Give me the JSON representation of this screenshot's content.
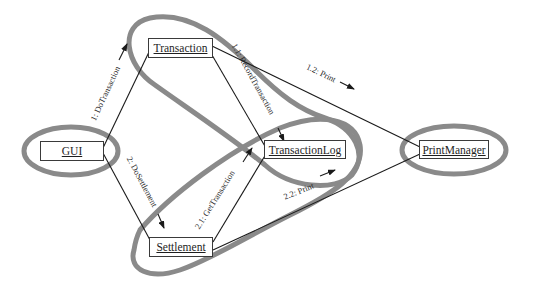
{
  "diagram": {
    "type": "UML collaboration diagram with clustered groupings",
    "objects": [
      {
        "id": "gui",
        "label": "GUI"
      },
      {
        "id": "transaction",
        "label": "Transaction"
      },
      {
        "id": "transactionlog",
        "label": "TransactionLog"
      },
      {
        "id": "settlement",
        "label": "Settlement"
      },
      {
        "id": "printmanager",
        "label": "PrintManager"
      }
    ],
    "messages": [
      {
        "id": "m1",
        "label": "1: DoTransaction",
        "from": "GUI",
        "to": "Transaction"
      },
      {
        "id": "m11",
        "label": "1.1: RecordTransaction",
        "from": "Transaction",
        "to": "TransactionLog"
      },
      {
        "id": "m12",
        "label": "1.2: Print",
        "from": "Transaction",
        "to": "PrintManager"
      },
      {
        "id": "m2",
        "label": "2: DoSettlement",
        "from": "GUI",
        "to": "Settlement"
      },
      {
        "id": "m21",
        "label": "2.1: GetTransaction",
        "from": "Settlement",
        "to": "TransactionLog"
      },
      {
        "id": "m22",
        "label": "2.2: Print",
        "from": "Settlement",
        "to": "PrintManager"
      }
    ],
    "clusters": [
      {
        "id": "c1",
        "members": [
          "GUI"
        ]
      },
      {
        "id": "c2",
        "members": [
          "Transaction",
          "TransactionLog"
        ]
      },
      {
        "id": "c3",
        "members": [
          "Settlement",
          "TransactionLog"
        ]
      },
      {
        "id": "c4",
        "members": [
          "PrintManager"
        ]
      }
    ],
    "colors": {
      "cluster_stroke": "#8a8a8a",
      "line": "#1a1a1a",
      "box_border": "#3a3a3a",
      "background": "#ffffff"
    }
  }
}
